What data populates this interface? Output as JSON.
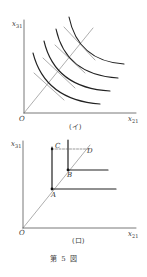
{
  "figure": {
    "caption": "第 5 図",
    "panels": [
      {
        "id": "i",
        "label": "(イ)",
        "axes": {
          "y_label": "x",
          "y_sub": "31",
          "x_label": "x",
          "x_sub": "21",
          "origin": "O"
        },
        "description": "Four convex indifference curves with tangent lines crossing a ray from the origin"
      },
      {
        "id": "ro",
        "label": "(ロ)",
        "axes": {
          "y_label": "x",
          "y_sub": "31",
          "x_label": "x",
          "x_sub": "21",
          "origin": "O"
        },
        "points": {
          "A": "A",
          "B": "B",
          "C": "C",
          "D": "D"
        },
        "description": "L-shaped (right-angle) isoquants with corners A and B on a ray from origin; dashed line from C to D"
      }
    ]
  }
}
